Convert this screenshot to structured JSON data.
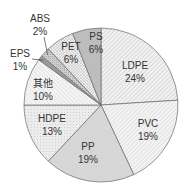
{
  "chart_data": {
    "type": "pie",
    "title": "",
    "start_angle_deg": 0,
    "direction": "clockwise",
    "categories": [
      "LDPE",
      "PVC",
      "PP",
      "HDPE",
      "其他",
      "EPS",
      "ABS",
      "PET",
      "PS"
    ],
    "values": [
      24,
      19,
      19,
      13,
      10,
      1,
      2,
      6,
      6
    ],
    "labels": [
      "24%",
      "19%",
      "19%",
      "13%",
      "10%",
      "1%",
      "2%",
      "6%",
      "6%"
    ],
    "unit": "%",
    "legend": "none (labels on slices)",
    "label_positions": [
      {
        "name": "LDPE",
        "x": 135,
        "y": 69,
        "y2": 82,
        "external": false
      },
      {
        "name": "PVC",
        "x": 148,
        "y": 127,
        "y2": 140,
        "external": false
      },
      {
        "name": "PP",
        "x": 88,
        "y": 150,
        "y2": 163,
        "external": false
      },
      {
        "name": "HDPE",
        "x": 52,
        "y": 122,
        "y2": 135,
        "external": false
      },
      {
        "name": "其他",
        "x": 43,
        "y": 87,
        "y2": 100,
        "external": false
      },
      {
        "name": "EPS",
        "x": 20,
        "y": 57,
        "y2": 70,
        "external": true
      },
      {
        "name": "ABS",
        "x": 40,
        "y": 22,
        "y2": 35,
        "external": true
      },
      {
        "name": "PET",
        "x": 71,
        "y": 50,
        "y2": 63,
        "external": false
      },
      {
        "name": "PS",
        "x": 96,
        "y": 40,
        "y2": 53,
        "external": false
      }
    ]
  }
}
